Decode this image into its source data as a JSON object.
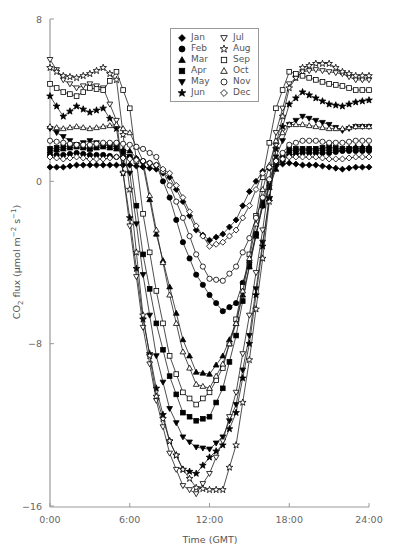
{
  "chart_data": {
    "type": "line",
    "title": "",
    "xlabel": "Time (GMT)",
    "ylabel": "CO2 flux (µmol m-2 s-1)",
    "ylabel_parts": {
      "pre": "CO",
      "sub": "2",
      "mid": " flux (µmol m",
      "sup1": "−2",
      "mid2": " s",
      "sup2": "−1",
      "post": ")"
    },
    "xlim": [
      0,
      24
    ],
    "ylim": [
      -16,
      8
    ],
    "x_ticks": [
      0,
      6,
      12,
      18,
      24
    ],
    "x_tick_labels": [
      "0:00",
      "6:00",
      "12:00",
      "18:00",
      "24:00"
    ],
    "y_ticks": [
      8,
      0,
      -8,
      -16
    ],
    "y_tick_labels": [
      "8",
      "0",
      "−8",
      "−16"
    ],
    "grid": false,
    "legend_position": "upper center",
    "x": [
      0,
      1,
      2,
      3,
      4,
      5,
      6,
      7,
      8,
      9,
      10,
      11,
      12,
      13,
      14,
      15,
      16,
      17,
      18,
      19,
      20,
      21,
      22,
      23,
      24
    ],
    "series": [
      {
        "name": "Jan",
        "marker": "diamond-filled",
        "values": [
          0.7,
          0.7,
          0.8,
          0.8,
          0.8,
          0.8,
          0.8,
          0.7,
          0.6,
          0.2,
          -1.0,
          -2.4,
          -2.9,
          -2.6,
          -1.9,
          -0.5,
          0.5,
          0.8,
          0.9,
          0.8,
          0.8,
          0.7,
          0.6,
          0.7,
          0.7
        ]
      },
      {
        "name": "Feb",
        "marker": "circle-filled",
        "values": [
          1.3,
          1.3,
          1.4,
          1.3,
          1.3,
          1.2,
          1.2,
          1.0,
          0.8,
          -0.8,
          -3.0,
          -4.6,
          -5.6,
          -6.4,
          -6.0,
          -4.0,
          -1.2,
          0.8,
          1.3,
          1.4,
          1.4,
          1.4,
          1.5,
          1.5,
          1.5
        ]
      },
      {
        "name": "Mar",
        "marker": "triangle-filled",
        "values": [
          1.5,
          1.6,
          1.7,
          1.6,
          1.7,
          1.6,
          1.5,
          0.8,
          -2.6,
          -5.2,
          -7.8,
          -9.4,
          -9.5,
          -8.6,
          -7.0,
          -4.2,
          -1.2,
          0.6,
          1.5,
          1.6,
          1.6,
          1.6,
          1.6,
          1.7,
          1.7
        ]
      },
      {
        "name": "Apr",
        "marker": "square-filled",
        "values": [
          1.6,
          1.7,
          1.8,
          1.6,
          1.8,
          1.7,
          1.2,
          -3.6,
          -7.0,
          -9.6,
          -11.4,
          -11.8,
          -11.6,
          -10.2,
          -7.6,
          -4.2,
          -1.0,
          1.0,
          1.6,
          1.6,
          1.6,
          1.7,
          1.6,
          1.6,
          1.6
        ]
      },
      {
        "name": "May",
        "marker": "triangle-down-filled",
        "values": [
          2.6,
          2.2,
          1.8,
          2.0,
          1.8,
          1.8,
          0.4,
          -4.6,
          -8.6,
          -11.2,
          -12.6,
          -13.1,
          -13.2,
          -12.6,
          -11.0,
          -7.6,
          -3.0,
          1.2,
          2.8,
          3.2,
          3.0,
          2.8,
          2.5,
          2.7,
          2.7
        ]
      },
      {
        "name": "Jun",
        "marker": "star-filled",
        "values": [
          4.2,
          3.2,
          3.7,
          3.4,
          3.6,
          2.6,
          -1.8,
          -6.8,
          -10.2,
          -12.8,
          -14.2,
          -14.4,
          -13.6,
          -13.0,
          -11.4,
          -8.0,
          -3.2,
          1.6,
          3.8,
          4.4,
          4.1,
          3.8,
          3.7,
          3.9,
          4.0
        ]
      },
      {
        "name": "Jul",
        "marker": "triangle-down-open",
        "values": [
          6.0,
          5.0,
          4.6,
          4.8,
          4.6,
          3.0,
          -2.2,
          -7.2,
          -10.8,
          -13.4,
          -15.0,
          -15.4,
          -14.4,
          -12.8,
          -10.4,
          -6.6,
          -2.4,
          2.4,
          4.8,
          5.4,
          5.5,
          5.4,
          5.3,
          5.0,
          5.0
        ]
      },
      {
        "name": "Aug",
        "marker": "star-open",
        "values": [
          5.6,
          5.2,
          5.1,
          5.3,
          5.6,
          5.0,
          -0.4,
          -6.6,
          -10.6,
          -12.8,
          -14.2,
          -15.1,
          -15.2,
          -15.2,
          -13.0,
          -8.8,
          -3.8,
          1.8,
          4.6,
          5.6,
          5.8,
          5.8,
          5.4,
          5.2,
          5.2
        ]
      },
      {
        "name": "Sep",
        "marker": "square-open",
        "values": [
          4.8,
          4.4,
          4.2,
          4.6,
          4.5,
          5.4,
          3.6,
          -1.6,
          -5.4,
          -8.6,
          -10.4,
          -11.0,
          -10.4,
          -9.2,
          -6.8,
          -3.6,
          0.2,
          3.6,
          5.4,
          5.2,
          5.0,
          4.8,
          4.7,
          4.5,
          4.5
        ]
      },
      {
        "name": "Oct",
        "marker": "triangle-open",
        "values": [
          2.7,
          2.6,
          2.7,
          2.6,
          2.7,
          2.8,
          2.4,
          1.0,
          -2.4,
          -5.6,
          -8.4,
          -10.0,
          -10.2,
          -9.0,
          -7.0,
          -3.8,
          -0.4,
          2.0,
          2.8,
          2.8,
          2.7,
          2.6,
          2.6,
          2.7,
          2.7
        ]
      },
      {
        "name": "Nov",
        "marker": "circle-open",
        "values": [
          2.0,
          1.9,
          1.8,
          1.8,
          1.9,
          1.9,
          1.8,
          1.6,
          1.2,
          -0.2,
          -1.8,
          -3.6,
          -4.8,
          -4.9,
          -4.2,
          -2.8,
          -0.8,
          1.0,
          1.8,
          2.0,
          2.0,
          1.9,
          1.9,
          2.0,
          2.0
        ]
      },
      {
        "name": "Dec",
        "marker": "diamond-open",
        "values": [
          1.2,
          1.1,
          1.2,
          1.1,
          1.1,
          1.2,
          1.1,
          1.0,
          0.8,
          0.4,
          -0.8,
          -2.2,
          -3.2,
          -3.0,
          -2.4,
          -1.2,
          0.4,
          1.0,
          1.2,
          1.2,
          1.2,
          1.1,
          1.1,
          1.2,
          1.2
        ]
      }
    ]
  },
  "legend": {
    "col1": [
      {
        "label": "Jan",
        "marker": "diamond-filled"
      },
      {
        "label": "Feb",
        "marker": "circle-filled"
      },
      {
        "label": "Mar",
        "marker": "triangle-filled"
      },
      {
        "label": "Apr",
        "marker": "square-filled"
      },
      {
        "label": "May",
        "marker": "triangle-down-filled"
      },
      {
        "label": "Jun",
        "marker": "star-filled"
      }
    ],
    "col2": [
      {
        "label": "Jul",
        "marker": "triangle-down-open"
      },
      {
        "label": "Aug",
        "marker": "star-open"
      },
      {
        "label": "Sep",
        "marker": "square-open"
      },
      {
        "label": "Oct",
        "marker": "triangle-open"
      },
      {
        "label": "Nov",
        "marker": "circle-open"
      },
      {
        "label": "Dec",
        "marker": "diamond-open"
      }
    ]
  },
  "colors": {
    "axis": "#999999",
    "line": "#222222",
    "marker": "#000000",
    "text": "#666666"
  }
}
